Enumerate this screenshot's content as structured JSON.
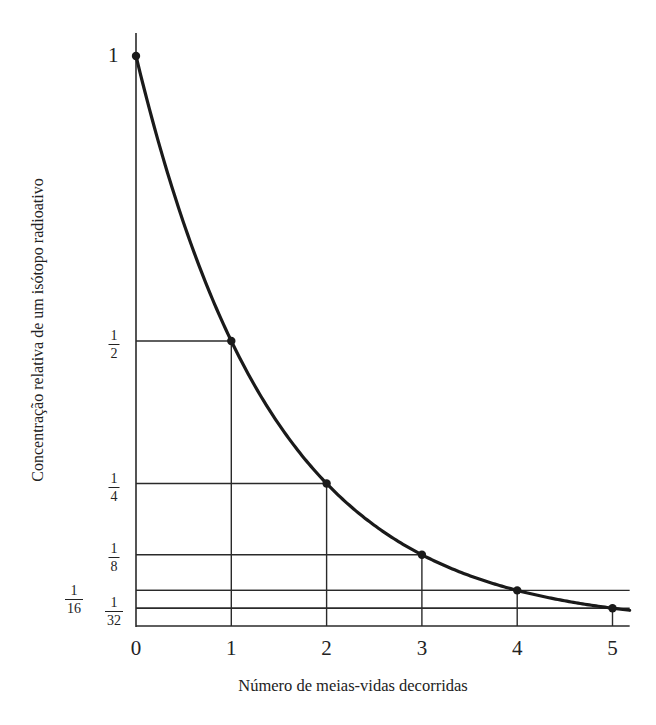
{
  "chart_data": {
    "type": "line",
    "title": "",
    "xlabel": "Número de meias-vidas decorridas",
    "ylabel": "Concentração relativa de um isótopo radioativo",
    "x": [
      0,
      1,
      2,
      3,
      4,
      5
    ],
    "series": [
      {
        "name": "Concentração relativa",
        "values": [
          1,
          0.5,
          0.25,
          0.125,
          0.0625,
          0.03125
        ],
        "markers": true,
        "curve": "exponential decay (smooth)"
      }
    ],
    "xticks": [
      "0",
      "1",
      "2",
      "3",
      "4",
      "5"
    ],
    "yticks": [
      {
        "value": 1,
        "label": "1"
      },
      {
        "value": 0.5,
        "label": "1/2",
        "num": "1",
        "den": "2"
      },
      {
        "value": 0.25,
        "label": "1/4",
        "num": "1",
        "den": "4"
      },
      {
        "value": 0.125,
        "label": "1/8",
        "num": "1",
        "den": "8"
      },
      {
        "value": 0.0625,
        "label": "1/16",
        "num": "1",
        "den": "16"
      },
      {
        "value": 0.03125,
        "label": "1/32",
        "num": "1",
        "den": "32"
      }
    ],
    "xlim": [
      0,
      5.18
    ],
    "ylim": [
      0,
      1.04
    ],
    "grid": "drop lines from each marked point to both axes",
    "legend": "none",
    "colors": {
      "line": "#1a1a1a",
      "axis": "#2a2a2a",
      "background": "#ffffff"
    }
  },
  "labels": {
    "x_axis_title": "Número de meias-vidas decorridas",
    "y_axis_title": "Concentração relativa de um isótopo radioativo",
    "x_ticks": [
      "0",
      "1",
      "2",
      "3",
      "4",
      "5"
    ],
    "y_tick_one": "1",
    "y_fracs": [
      {
        "num": "1",
        "den": "2"
      },
      {
        "num": "1",
        "den": "4"
      },
      {
        "num": "1",
        "den": "8"
      },
      {
        "num": "1",
        "den": "16"
      },
      {
        "num": "1",
        "den": "32"
      }
    ]
  }
}
